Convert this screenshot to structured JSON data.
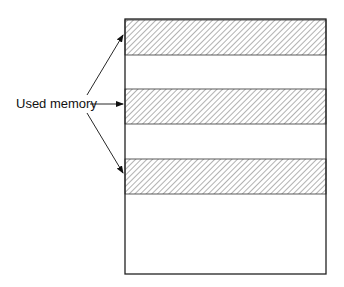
{
  "diagram": {
    "label": "Used memory",
    "memory_block": {
      "x": 125,
      "y": 19,
      "width": 201,
      "height": 255
    },
    "used_regions": [
      {
        "name": "used-region-1",
        "y": 20,
        "height": 35
      },
      {
        "name": "used-region-2",
        "y": 89,
        "height": 35
      },
      {
        "name": "used-region-3",
        "y": 159,
        "height": 35
      }
    ],
    "colors": {
      "stroke": "#222222",
      "hatch": "#555555",
      "background": "#ffffff"
    }
  }
}
